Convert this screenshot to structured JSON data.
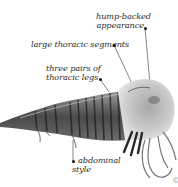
{
  "diagram": {
    "labels": [
      {
        "id": "hump",
        "line1": "hump-backed",
        "line2": "appearance"
      },
      {
        "id": "segments",
        "line1": "large thoracic segments"
      },
      {
        "id": "legs",
        "line1": "three pairs of",
        "line2": "thoracic legs"
      },
      {
        "id": "style",
        "line1": "abdominal",
        "line2": "style"
      }
    ],
    "colors": {
      "background": "#ffffff",
      "text": "#2a2a2a",
      "leader_line": "#333333",
      "body_dark": "#3a3a3a",
      "body_mid": "#7a7a7a",
      "body_light": "#bdbdbd"
    },
    "corner_mark": "©"
  }
}
